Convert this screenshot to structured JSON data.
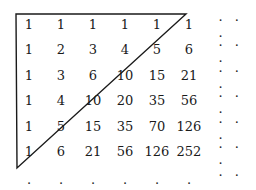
{
  "diagram": {
    "title": "",
    "rows": [
      [
        "1",
        "1",
        "1",
        "1",
        "1",
        "1"
      ],
      [
        "1",
        "2",
        "3",
        "4",
        "5",
        "6"
      ],
      [
        "1",
        "3",
        "6",
        "10",
        "15",
        "21"
      ],
      [
        "1",
        "4",
        "10",
        "20",
        "35",
        "56"
      ],
      [
        "1",
        "5",
        "15",
        "35",
        "70",
        "126"
      ],
      [
        "1",
        "6",
        "21",
        "56",
        "126",
        "252"
      ]
    ],
    "row_ellipsis": ". . .",
    "bottom_row": [
      ".",
      ".",
      ".",
      ".",
      ".",
      ".",
      ". . ."
    ],
    "triangle": {
      "vertices": [
        [
          16,
          14
        ],
        [
          186,
          14
        ],
        [
          17,
          168
        ]
      ],
      "stroke_color": "#1a1a1a"
    }
  }
}
